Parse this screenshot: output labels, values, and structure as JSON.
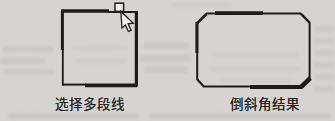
{
  "document": {
    "kind": "scanned-book-figure",
    "topic": "polyline chamfer illustration"
  },
  "figures": [
    {
      "id": "select-polyline",
      "caption": "选择多段线"
    },
    {
      "id": "chamfer-result",
      "caption": "倒斜角结果"
    }
  ],
  "icons": {
    "pick_cursor": "arrow-pointer-icon",
    "pickbox": "selection-pickbox-square"
  },
  "colors": {
    "paper": "#d6d5d1",
    "ink": "#1c1c1a",
    "cursor_fill": "#f2f1ee",
    "bleed_smudge": "#b3b2ad"
  }
}
